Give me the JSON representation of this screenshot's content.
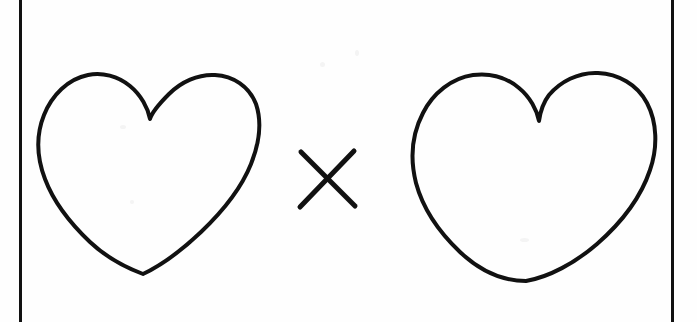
{
  "page": {
    "kind": "scanned-worksheet",
    "background_color": "#fefefe",
    "ink_color": "#111111",
    "width": 697,
    "height": 322
  },
  "frame": {
    "left_rule": {
      "name": "left-page-rule",
      "x": 19,
      "width": 3,
      "color": "#111111"
    },
    "right_rule": {
      "name": "right-page-rule",
      "x": 671,
      "width": 3,
      "color": "#111111"
    }
  },
  "expression": {
    "reading": "heart × heart",
    "operator_symbol": "×",
    "operator_label": "multiplication-sign",
    "operand_count": 2
  },
  "figures": [
    {
      "name": "left-heart",
      "label": "heart",
      "fill": "none",
      "stroke": "#111111",
      "stroke_width": 4,
      "bbox": {
        "x": 37,
        "y": 74,
        "width": 226,
        "height": 204
      },
      "cleft_point": {
        "x": 150,
        "y": 119
      },
      "bottom_point": {
        "x": 143,
        "y": 274
      }
    },
    {
      "name": "operator-x",
      "label": "×",
      "fill": "none",
      "stroke": "#111111",
      "stroke_width": 5,
      "bbox": {
        "x": 300,
        "y": 150,
        "width": 55,
        "height": 58
      },
      "center": {
        "x": 327,
        "y": 179
      }
    },
    {
      "name": "right-heart",
      "label": "heart",
      "fill": "none",
      "stroke": "#111111",
      "stroke_width": 4,
      "bbox": {
        "x": 408,
        "y": 73,
        "width": 247,
        "height": 212
      },
      "cleft_point": {
        "x": 539,
        "y": 121
      },
      "bottom_point": {
        "x": 526,
        "y": 281
      }
    }
  ],
  "paths": {
    "left_heart_d": "M150 119 C148 108 141 95 130 86 C118 76 102 72 88 75 C68 79 52 95 44 115 C36 135 37 158 45 179 C54 203 71 224 90 242 C108 259 127 268 143 274 C160 266 182 250 201 232 C222 212 241 189 251 164 C259 144 262 122 256 104 C249 86 233 76 215 75 C198 74 181 82 169 94 C158 105 152 112 150 119 Z",
    "right_heart_d": "M539 121 C537 110 530 97 519 88 C506 77 489 73 473 75 C452 78 433 93 423 113 C412 134 410 159 416 183 C423 209 440 233 460 252 C480 271 503 281 526 281 C549 277 575 263 597 244 C621 223 641 197 650 170 C658 147 657 122 647 103 C637 84 618 74 598 73 C578 72 560 82 549 95 C542 104 540 114 539 121 Z",
    "operator_x_d1": "M301 152 L355 206",
    "operator_x_d2": "M354 151 L300 207"
  }
}
